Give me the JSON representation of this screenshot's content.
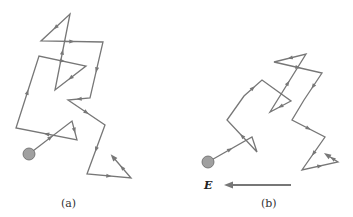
{
  "panels": [
    {
      "id": "a",
      "caption": "(a)",
      "caption_pos": [
        68,
        207
      ],
      "start_dot": {
        "cx": 29,
        "cy": 154,
        "r": 6
      },
      "path": [
        [
          29,
          154
        ],
        [
          72,
          121
        ],
        [
          77,
          140
        ],
        [
          16,
          128
        ],
        [
          39,
          56
        ],
        [
          86,
          66
        ],
        [
          55,
          90
        ],
        [
          70,
          14
        ],
        [
          41,
          41
        ],
        [
          103,
          42
        ],
        [
          90,
          98
        ],
        [
          68,
          100
        ],
        [
          105,
          125
        ],
        [
          87,
          174
        ],
        [
          131,
          178
        ],
        [
          113,
          157
        ]
      ],
      "arrow_segments": [
        0,
        1,
        2,
        3,
        4,
        5,
        6,
        7,
        8,
        9,
        10,
        11,
        12,
        13,
        14
      ]
    },
    {
      "id": "b",
      "caption": "(b)",
      "caption_pos": [
        268,
        207
      ],
      "start_dot": {
        "cx": 208,
        "cy": 162,
        "r": 6
      },
      "path": [
        [
          208,
          162
        ],
        [
          252,
          137
        ],
        [
          257,
          152
        ],
        [
          227,
          120
        ],
        [
          244,
          96
        ],
        [
          262,
          80
        ],
        [
          291,
          101
        ],
        [
          270,
          112
        ],
        [
          306,
          54
        ],
        [
          274,
          62
        ],
        [
          322,
          73
        ],
        [
          304,
          100
        ],
        [
          292,
          120
        ],
        [
          325,
          137
        ],
        [
          302,
          170
        ],
        [
          338,
          162
        ],
        [
          327,
          155
        ]
      ],
      "arrow_segments": [
        0,
        2,
        4,
        6,
        7,
        8,
        9,
        10,
        12,
        13,
        14,
        15
      ]
    }
  ],
  "field": {
    "symbol": "E",
    "label_pos": [
      211,
      190
    ],
    "arrow": {
      "x1": 291,
      "y1": 185,
      "x2": 224,
      "y2": 185
    },
    "direction": "left"
  },
  "colors": {
    "path": "#777777",
    "dot_fill": "#a0a0a0",
    "dot_stroke": "#666666",
    "field_arrow": "#777777",
    "text": "#333333"
  }
}
